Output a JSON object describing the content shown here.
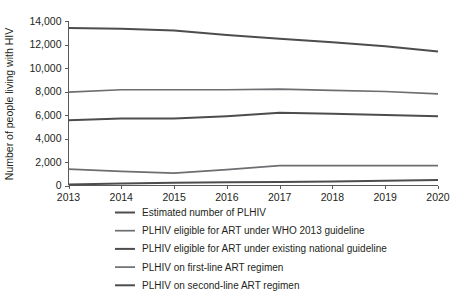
{
  "chart_data": {
    "type": "line",
    "title": "",
    "xlabel": "",
    "ylabel": "Number of people living with HIV",
    "x": [
      2013,
      2014,
      2015,
      2016,
      2017,
      2018,
      2019,
      2020
    ],
    "xtick_labels": [
      "2013",
      "2014",
      "2015",
      "2016",
      "2017",
      "2018",
      "2019",
      "2020"
    ],
    "ytick_labels": [
      "0",
      "2,000",
      "4,000",
      "6,000",
      "8,000",
      "10,000",
      "12,000",
      "14,000"
    ],
    "ytick_values": [
      0,
      2000,
      4000,
      6000,
      8000,
      10000,
      12000,
      14000
    ],
    "ylim": [
      0,
      14000
    ],
    "xlim": [
      2013,
      2020
    ],
    "grid": false,
    "legend_position": "below",
    "series": [
      {
        "name": "Estimated number of PLHIV",
        "color": "#4d4d4f",
        "width": 2.0,
        "values": [
          13400,
          13350,
          13200,
          12800,
          12500,
          12200,
          11850,
          11400
        ]
      },
      {
        "name": "PLHIV eligible for ART under WHO 2013 guideline",
        "color": "#6d6e71",
        "width": 1.7,
        "values": [
          7950,
          8150,
          8150,
          8150,
          8200,
          8100,
          8000,
          7800
        ]
      },
      {
        "name": "PLHIV eligible for ART under existing national guideline",
        "color": "#4d4d4f",
        "width": 2.0,
        "values": [
          5550,
          5700,
          5700,
          5900,
          6200,
          6100,
          6000,
          5900
        ]
      },
      {
        "name": "PLHIV on first-line ART regimen",
        "color": "#6d6e71",
        "width": 1.7,
        "values": [
          1400,
          1200,
          1050,
          1350,
          1700,
          1700,
          1700,
          1700
        ]
      },
      {
        "name": "PLHIV on second-line ART regimen",
        "color": "#4d4d4f",
        "width": 2.0,
        "values": [
          80,
          180,
          230,
          270,
          300,
          350,
          400,
          470
        ]
      }
    ]
  },
  "legend": {
    "items": [
      "Estimated number of PLHIV",
      "PLHIV eligible for ART under WHO 2013 guideline",
      "PLHIV eligible for ART under existing national guideline",
      "PLHIV on first-line ART regimen",
      "PLHIV on second-line ART regimen"
    ]
  }
}
